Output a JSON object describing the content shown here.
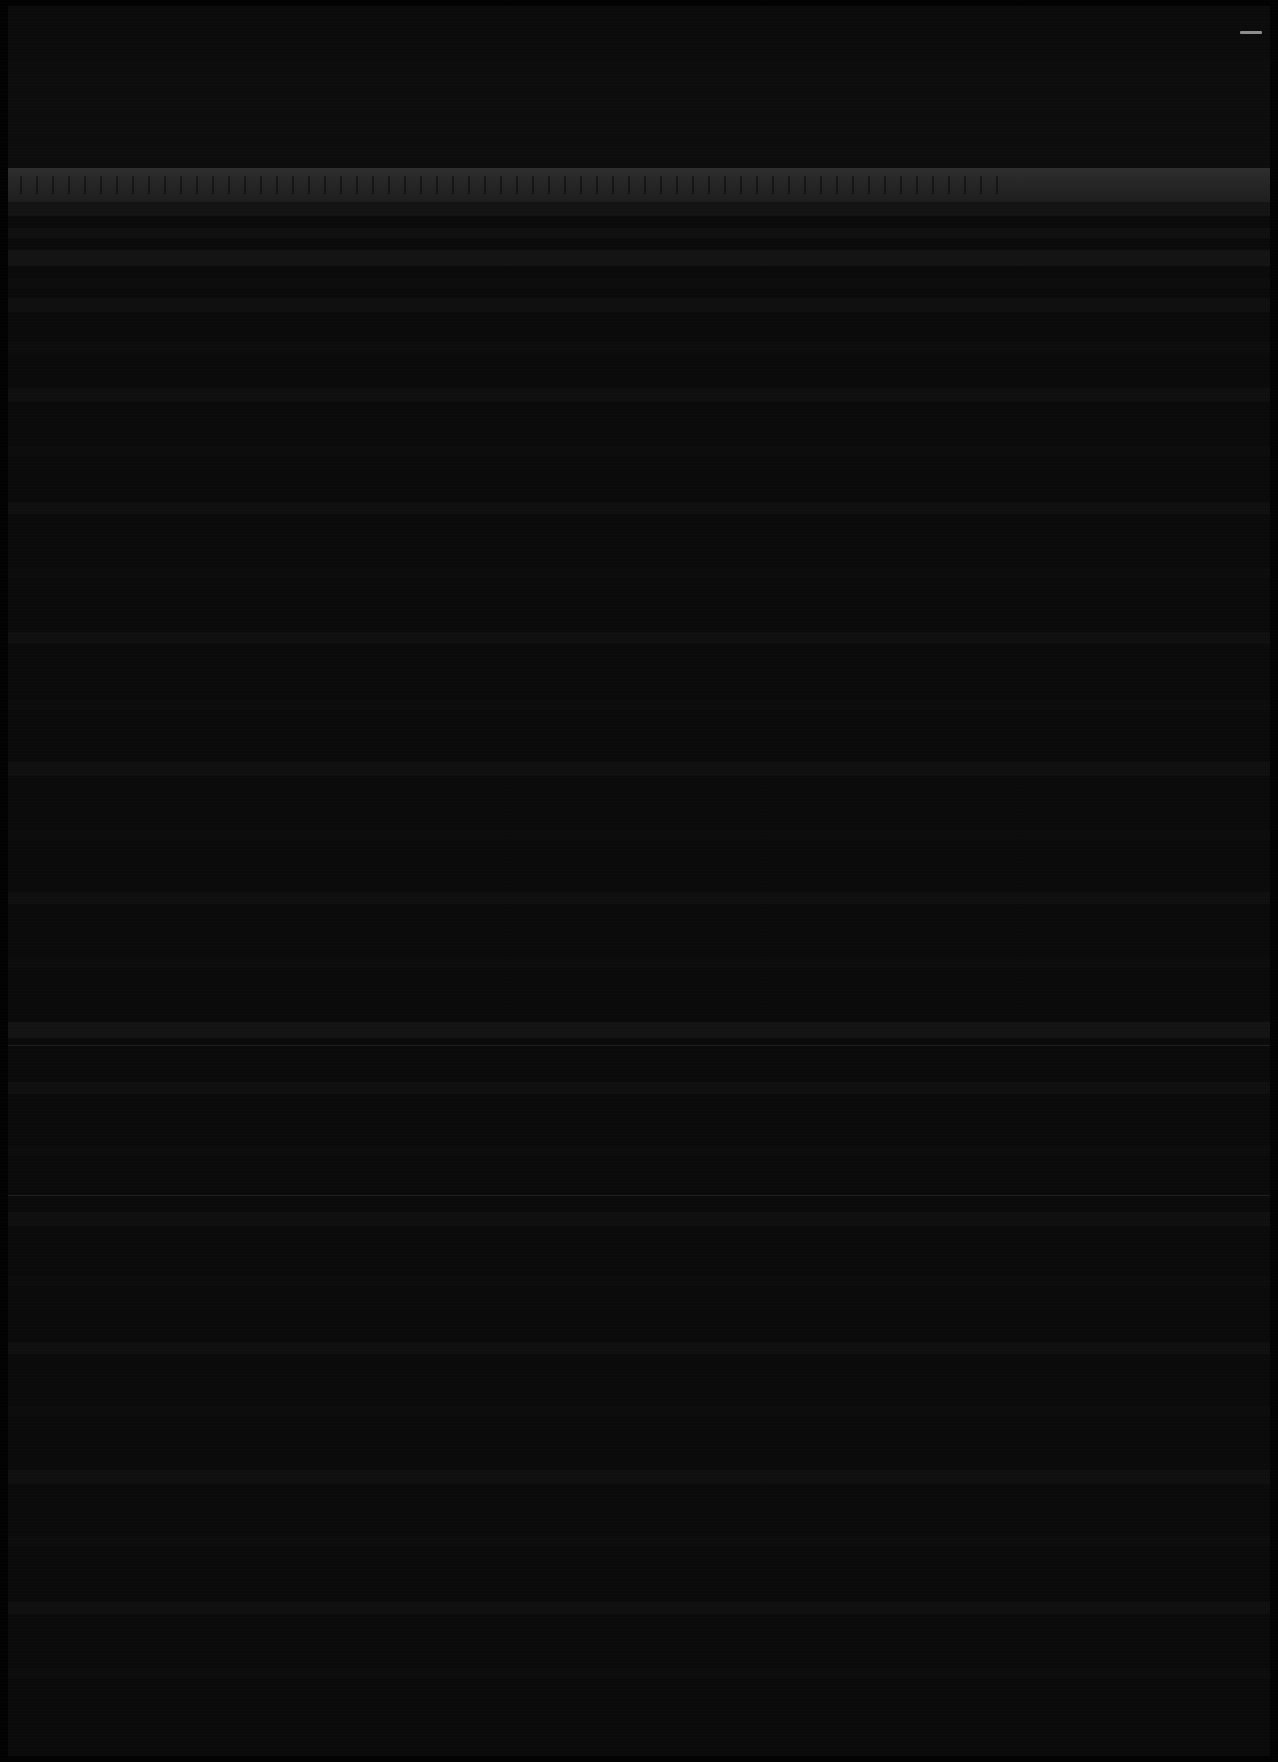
{
  "capture": {
    "width": 1278,
    "height": 1762,
    "legibility_note": "Screenshot is near-black; no text is legible at any magnification.",
    "background_color": "#070707",
    "frame_color": "#020202",
    "content_color": "#0a0a0a"
  },
  "titlebar": {
    "name": "window-titlebar",
    "top": 6,
    "height": 56,
    "background": "#0b0b0b",
    "controls": [
      {
        "name": "minimize-glyph",
        "icon": "minimize-icon",
        "label": "",
        "x": 1240,
        "y": 27,
        "color": "#8d8d8d"
      }
    ]
  },
  "upper_block": {
    "name": "upper-content-block",
    "top": 62,
    "height": 106,
    "background": "#0c0c0c"
  },
  "toolbar": {
    "name": "main-toolbar",
    "top": 168,
    "height": 34,
    "background_top": "#2d2d2d",
    "background_bottom": "#1d1d1d",
    "tick_count": 62,
    "tick_color": "#000000"
  },
  "content": {
    "name": "document-content-area",
    "top": 202,
    "height": 1554,
    "background": "#0a0a0a",
    "line_pitch": 50,
    "bands": [
      {
        "top": 0,
        "height": 14,
        "intensity": "strong"
      },
      {
        "top": 26,
        "height": 10,
        "intensity": "normal"
      },
      {
        "top": 48,
        "height": 16,
        "intensity": "strong"
      },
      {
        "top": 76,
        "height": 10,
        "intensity": "faint"
      },
      {
        "top": 96,
        "height": 14,
        "intensity": "normal"
      },
      {
        "top": 140,
        "height": 12,
        "intensity": "faint"
      },
      {
        "top": 186,
        "height": 14,
        "intensity": "normal"
      },
      {
        "top": 244,
        "height": 10,
        "intensity": "faint"
      },
      {
        "top": 300,
        "height": 12,
        "intensity": "normal"
      },
      {
        "top": 366,
        "height": 10,
        "intensity": "faint"
      },
      {
        "top": 430,
        "height": 12,
        "intensity": "normal"
      },
      {
        "top": 498,
        "height": 10,
        "intensity": "faint"
      },
      {
        "top": 560,
        "height": 14,
        "intensity": "normal"
      },
      {
        "top": 628,
        "height": 10,
        "intensity": "faint"
      },
      {
        "top": 690,
        "height": 12,
        "intensity": "normal"
      },
      {
        "top": 756,
        "height": 10,
        "intensity": "faint"
      },
      {
        "top": 820,
        "height": 16,
        "intensity": "strong"
      },
      {
        "top": 880,
        "height": 12,
        "intensity": "normal"
      },
      {
        "top": 944,
        "height": 10,
        "intensity": "faint"
      },
      {
        "top": 1010,
        "height": 14,
        "intensity": "normal"
      },
      {
        "top": 1074,
        "height": 10,
        "intensity": "faint"
      },
      {
        "top": 1140,
        "height": 12,
        "intensity": "normal"
      },
      {
        "top": 1204,
        "height": 10,
        "intensity": "faint"
      },
      {
        "top": 1268,
        "height": 14,
        "intensity": "normal"
      },
      {
        "top": 1334,
        "height": 10,
        "intensity": "faint"
      },
      {
        "top": 1400,
        "height": 12,
        "intensity": "normal"
      },
      {
        "top": 1466,
        "height": 10,
        "intensity": "faint"
      }
    ],
    "dividers": [
      {
        "name": "divider-upper",
        "top": 843
      },
      {
        "name": "divider-lower",
        "top": 993
      }
    ]
  }
}
